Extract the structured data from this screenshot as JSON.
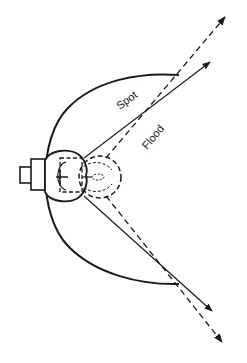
{
  "diagram": {
    "type": "spotlight beam diagram",
    "labels": {
      "spot": "Spot",
      "flood": "Flood"
    },
    "components": [
      "lamp-base",
      "bulb",
      "filament-spot-position",
      "filament-flood-position",
      "reflector",
      "spot-beam-rays",
      "flood-beam-rays"
    ],
    "colors": {
      "line": "#1a1a1a",
      "background": "#ffffff"
    }
  }
}
